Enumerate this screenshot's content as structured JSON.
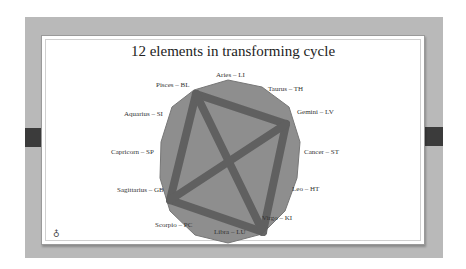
{
  "slide": {
    "title": "12 elements in transforming cycle",
    "footer_icon": "♁"
  },
  "colors": {
    "frame": "#b9b9b9",
    "polygon_fill": "#8e8e8e",
    "polygon_stroke": "#777777",
    "band": "#5e5e5e",
    "tabs": "#3b3b3b"
  },
  "nodes": [
    {
      "label": "Aries – LI"
    },
    {
      "label": "Taurus – TH"
    },
    {
      "label": "Gemini – LV"
    },
    {
      "label": "Cancer – ST"
    },
    {
      "label": "Leo – HT"
    },
    {
      "label": "Virgo – KI"
    },
    {
      "label": "Libra – LU"
    },
    {
      "label": "Scorpio – PC"
    },
    {
      "label": "Sagittarius – GB"
    },
    {
      "label": "Capricorn – SP"
    },
    {
      "label": "Aquarius – SI"
    },
    {
      "label": "Pisces – BL"
    }
  ],
  "connections": [
    [
      "Pisces",
      "Gemini"
    ],
    [
      "Gemini",
      "Virgo"
    ],
    [
      "Virgo",
      "Sagittarius"
    ],
    [
      "Sagittarius",
      "Pisces"
    ],
    [
      "Pisces",
      "Virgo"
    ],
    [
      "Gemini",
      "Sagittarius"
    ]
  ]
}
